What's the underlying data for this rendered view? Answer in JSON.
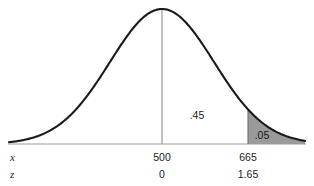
{
  "chart_data": {
    "type": "line",
    "title": "",
    "subtitle": "",
    "xlabel": "",
    "ylabel": "",
    "distribution": "normal",
    "mean_x": 500,
    "mean_z": 0,
    "cutoff_x": 665,
    "cutoff_z": 1.65,
    "sigma_x": 100,
    "grid": false,
    "legend": false,
    "axis_rows": [
      {
        "name": "x",
        "label": "x",
        "ticks": [
          {
            "value": "500",
            "z": 0
          },
          {
            "value": "665",
            "z": 1.65
          }
        ]
      },
      {
        "name": "z",
        "label": "z",
        "ticks": [
          {
            "value": "0",
            "z": 0
          },
          {
            "value": "1.65",
            "z": 1.65
          }
        ]
      }
    ],
    "regions": [
      {
        "name": "body-right-of-mean",
        "label": ".45",
        "probability": 0.45,
        "z_from": 0,
        "z_to": 1.65,
        "shaded": false
      },
      {
        "name": "upper-tail",
        "label": ".05",
        "probability": 0.05,
        "z_from": 1.65,
        "z_to": 3.2,
        "shaded": true
      }
    ],
    "x_axis_z_range": [
      -3.2,
      3.2
    ],
    "ylim": [
      0,
      1
    ]
  },
  "geometry": {
    "mean_line_x_px": 162,
    "cutoff_line_x_px": 248,
    "baseline_y_px": 144,
    "peak_y_px": 9,
    "curve_left_px": 9,
    "curve_right_px": 305,
    "label_45_x_px": 197,
    "label_45_y_px": 110,
    "label_05_x_px": 262,
    "label_05_y_px": 130,
    "axis_row_x_label_left_px": 10,
    "axis_row_x_label_y_px": 152,
    "axis_row_z_label_left_px": 10,
    "axis_row_z_label_y_px": 169,
    "tick_row_x_y_px": 152,
    "tick_row_z_y_px": 169
  },
  "colors": {
    "background": "#ffffff",
    "curve_stroke": "#1a1a1a",
    "baseline": "#9b9b9b",
    "mean_line": "#8d8d8d",
    "cutoff_line": "#6f6f6f",
    "tail_fill": "#9a9a9a",
    "text": "#1a1a1a"
  }
}
